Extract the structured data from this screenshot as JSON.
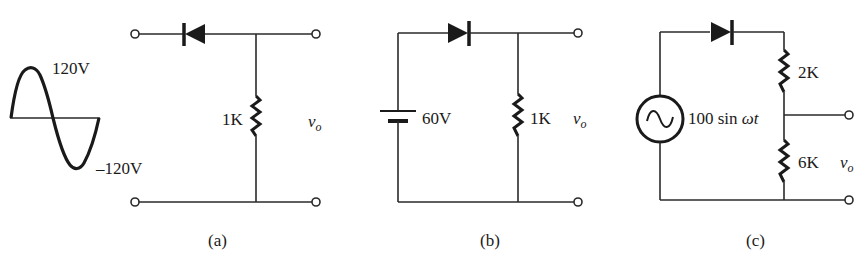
{
  "figure": {
    "panels": [
      {
        "id": "a",
        "caption": "(a)",
        "input_waveform": {
          "type": "sine",
          "peak_label": "120V",
          "trough_label": "–120V"
        },
        "components": [
          {
            "type": "diode",
            "orientation": "pointing-left",
            "position": "top-series"
          },
          {
            "type": "resistor",
            "label": "1K",
            "position": "shunt"
          }
        ],
        "output_label": "v",
        "output_subscript": "o"
      },
      {
        "id": "b",
        "caption": "(b)",
        "components": [
          {
            "type": "battery",
            "label": "60V",
            "position": "left-shunt"
          },
          {
            "type": "diode",
            "orientation": "pointing-right",
            "position": "top-series"
          },
          {
            "type": "resistor",
            "label": "1K",
            "position": "shunt"
          }
        ],
        "output_label": "v",
        "output_subscript": "o"
      },
      {
        "id": "c",
        "caption": "(c)",
        "components": [
          {
            "type": "ac-source",
            "label_prefix": "100 sin ",
            "label_omega": "ω",
            "label_t": "t"
          },
          {
            "type": "diode",
            "orientation": "pointing-right",
            "position": "top-series"
          },
          {
            "type": "resistor",
            "label": "2K",
            "position": "upper-divider"
          },
          {
            "type": "resistor",
            "label": "6K",
            "position": "lower-divider"
          }
        ],
        "output_label": "v",
        "output_subscript": "o"
      }
    ]
  }
}
